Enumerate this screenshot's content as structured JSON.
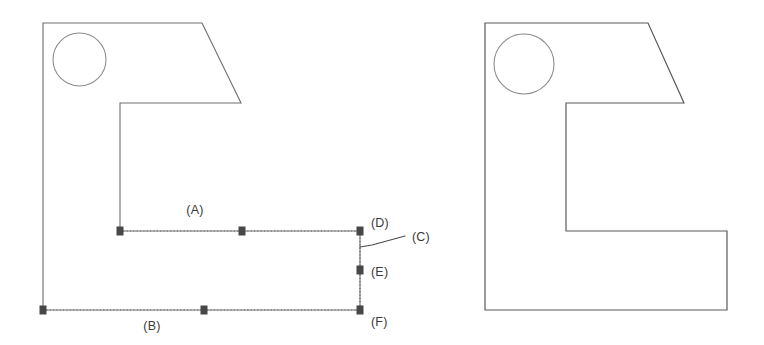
{
  "figure": {
    "background_color": "#ffffff",
    "line_color": "#6e6e6e",
    "dotted_color": "#5b5b5b",
    "marker_color": "#474747",
    "text_color": "#3a3a3a"
  },
  "labels": {
    "a": "(A)",
    "b": "(B)",
    "c": "(C)",
    "d": "(D)",
    "e": "(E)",
    "f": "(F)"
  },
  "left_view": {
    "name": "left-part-outline",
    "outline_points": "43,23 202,23 241,103 120,103 120,231 360,231 360,310 43,310 43,23",
    "hole": {
      "cx": 79.5,
      "cy": 59.5,
      "r": 26.5
    }
  },
  "right_view": {
    "name": "right-part-outline",
    "outline_points": "485,23 648,23 684,103 566,103 566,231 727,231 727,310 485,310 485,23",
    "hole": {
      "cx": 524,
      "cy": 64,
      "r": 30
    }
  },
  "dimension_lines": [
    {
      "name": "dimension-line-a",
      "x1": 120,
      "y1": 231,
      "x2": 360,
      "y2": 231
    },
    {
      "name": "dimension-line-b",
      "x1": 43,
      "y1": 310,
      "x2": 360,
      "y2": 310
    },
    {
      "name": "dimension-line-df",
      "x1": 360,
      "y1": 231,
      "x2": 360,
      "y2": 310
    }
  ],
  "markers": [
    {
      "name": "marker-a-start",
      "x": 120,
      "y": 231
    },
    {
      "name": "marker-a-mid",
      "x": 242,
      "y": 231
    },
    {
      "name": "marker-d",
      "x": 360,
      "y": 231
    },
    {
      "name": "marker-e",
      "x": 360,
      "y": 270
    },
    {
      "name": "marker-f",
      "x": 360,
      "y": 310
    },
    {
      "name": "marker-b-start",
      "x": 43,
      "y": 310
    },
    {
      "name": "marker-b-mid",
      "x": 204,
      "y": 310
    }
  ],
  "leader": {
    "name": "leader-line-c",
    "path": "M360,247 L372,245 L405,236"
  }
}
